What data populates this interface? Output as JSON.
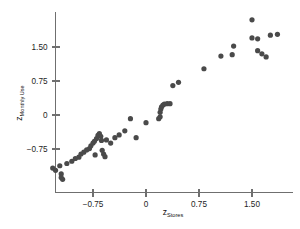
{
  "chart_data": {
    "type": "scatter",
    "title": "",
    "xlabel": "z Stores",
    "xlabel_main": "z",
    "xlabel_sub": "Stores",
    "ylabel": "z Monthly Use",
    "ylabel_main": "z",
    "ylabel_sub": "Monthly Use",
    "xticks": [
      -0.75,
      0,
      0.75,
      1.5
    ],
    "xtick_labels": [
      "−0.75",
      "0",
      "0.75",
      "1.50"
    ],
    "yticks": [
      -0.75,
      0,
      0.75,
      1.5
    ],
    "ytick_labels": [
      "−0.75",
      "0",
      "0.75",
      "1.50"
    ],
    "xlim": [
      -1.45,
      2.05
    ],
    "ylim": [
      -1.5,
      2.45
    ],
    "grid": false,
    "legend": null,
    "marker_color": "#4a4a4a",
    "marker_size": 2.6,
    "axis_color": "#6f6f6f",
    "background": "#ffffff",
    "points": [
      {
        "x": -1.32,
        "y": -1.17
      },
      {
        "x": -1.28,
        "y": -1.22
      },
      {
        "x": -1.22,
        "y": -1.12
      },
      {
        "x": -1.2,
        "y": -1.3
      },
      {
        "x": -1.2,
        "y": -1.38
      },
      {
        "x": -1.18,
        "y": -1.42
      },
      {
        "x": -1.12,
        "y": -1.07
      },
      {
        "x": -1.05,
        "y": -1.02
      },
      {
        "x": -1.0,
        "y": -0.96
      },
      {
        "x": -0.95,
        "y": -0.93
      },
      {
        "x": -0.92,
        "y": -0.86
      },
      {
        "x": -0.88,
        "y": -0.82
      },
      {
        "x": -0.84,
        "y": -0.77
      },
      {
        "x": -0.8,
        "y": -0.74
      },
      {
        "x": -0.78,
        "y": -0.68
      },
      {
        "x": -0.75,
        "y": -0.62
      },
      {
        "x": -0.73,
        "y": -0.58
      },
      {
        "x": -0.72,
        "y": -0.88
      },
      {
        "x": -0.7,
        "y": -0.52
      },
      {
        "x": -0.68,
        "y": -0.45
      },
      {
        "x": -0.66,
        "y": -0.41
      },
      {
        "x": -0.64,
        "y": -0.47
      },
      {
        "x": -0.63,
        "y": -0.56
      },
      {
        "x": -0.62,
        "y": -0.78
      },
      {
        "x": -0.6,
        "y": -0.86
      },
      {
        "x": -0.58,
        "y": -0.92
      },
      {
        "x": -0.56,
        "y": -0.55
      },
      {
        "x": -0.5,
        "y": -0.62
      },
      {
        "x": -0.44,
        "y": -0.5
      },
      {
        "x": -0.38,
        "y": -0.44
      },
      {
        "x": -0.3,
        "y": -0.35
      },
      {
        "x": -0.22,
        "y": -0.08
      },
      {
        "x": -0.14,
        "y": -0.5
      },
      {
        "x": 0.0,
        "y": -0.17
      },
      {
        "x": 0.18,
        "y": -0.08
      },
      {
        "x": 0.2,
        "y": -0.04
      },
      {
        "x": 0.2,
        "y": 0.06
      },
      {
        "x": 0.21,
        "y": 0.13
      },
      {
        "x": 0.22,
        "y": 0.18
      },
      {
        "x": 0.24,
        "y": 0.22
      },
      {
        "x": 0.26,
        "y": 0.24
      },
      {
        "x": 0.3,
        "y": 0.25
      },
      {
        "x": 0.34,
        "y": 0.25
      },
      {
        "x": 0.38,
        "y": 0.65
      },
      {
        "x": 0.46,
        "y": 0.72
      },
      {
        "x": 0.82,
        "y": 1.02
      },
      {
        "x": 1.06,
        "y": 1.3
      },
      {
        "x": 1.22,
        "y": 1.33
      },
      {
        "x": 1.24,
        "y": 1.52
      },
      {
        "x": 1.5,
        "y": 2.1
      },
      {
        "x": 1.5,
        "y": 1.7
      },
      {
        "x": 1.58,
        "y": 1.68
      },
      {
        "x": 1.58,
        "y": 1.42
      },
      {
        "x": 1.64,
        "y": 1.35
      },
      {
        "x": 1.7,
        "y": 1.28
      },
      {
        "x": 1.76,
        "y": 1.76
      },
      {
        "x": 1.86,
        "y": 1.78
      }
    ]
  }
}
